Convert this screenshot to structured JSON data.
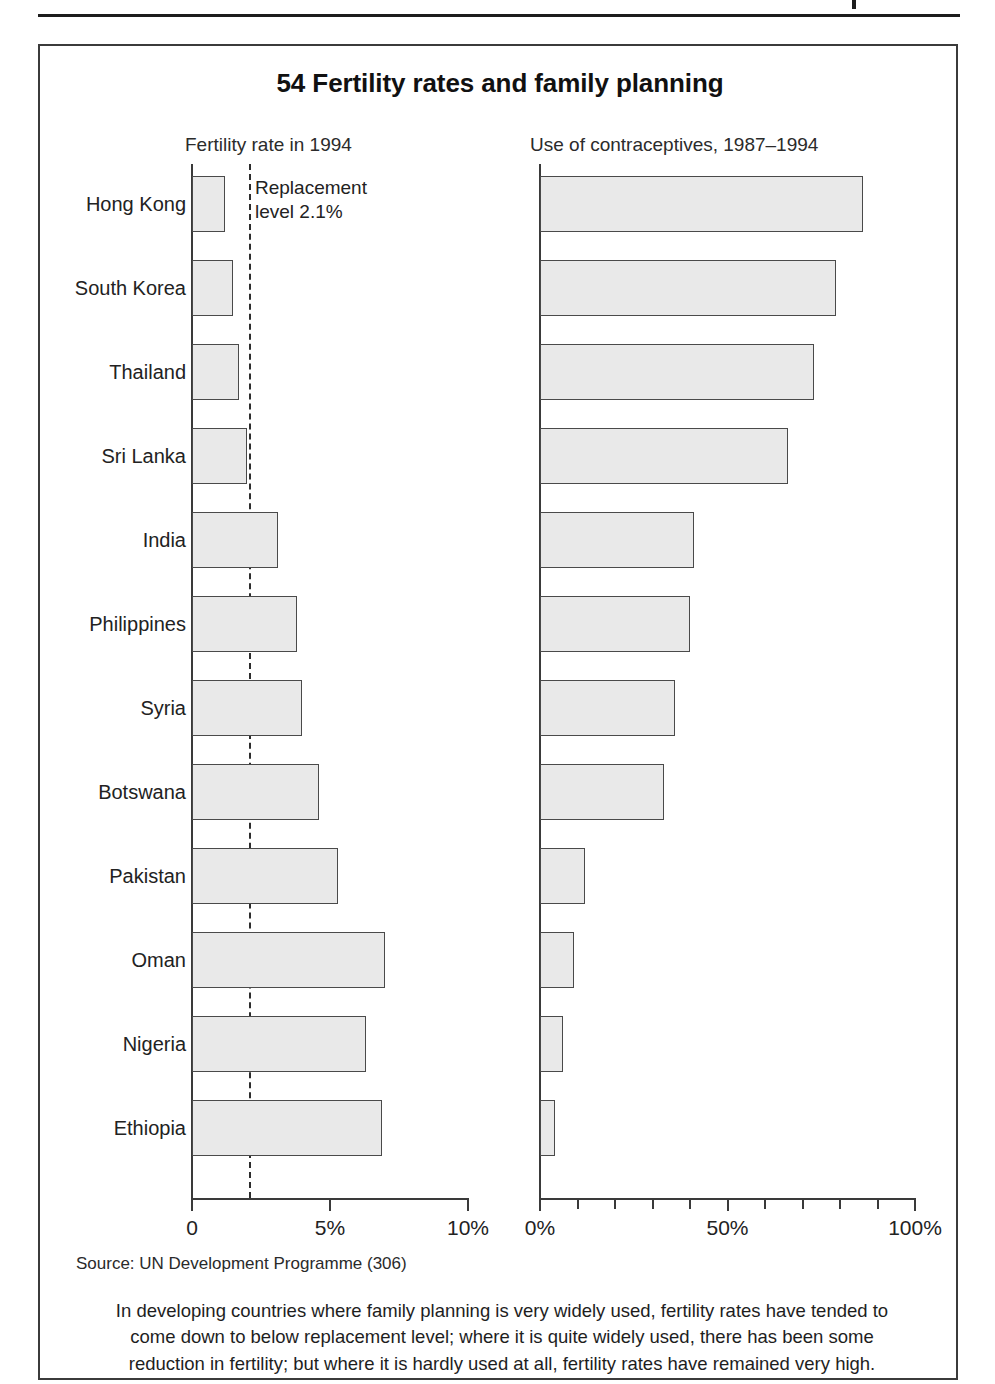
{
  "figure": {
    "title": "54 Fertility rates and family planning",
    "source": "Source: UN Development Programme (306)",
    "caption_line1": "In developing countries where family planning is very widely used, fertility rates have tended to",
    "caption_line2": "come down to below replacement level; where it is quite widely used, there has been some",
    "caption_line3": "reduction in fertility; but where it is hardly used at all, fertility rates have remained very high.",
    "annotation_line1": "Replacement",
    "annotation_line2": "level 2.1%"
  },
  "chart_data": [
    {
      "type": "bar",
      "orientation": "horizontal",
      "title": "Fertility rate in 1994",
      "xlabel": "",
      "ylabel": "",
      "xlim": [
        0,
        10
      ],
      "xticks": [
        0,
        5,
        10
      ],
      "xticklabels": [
        "0",
        "5%",
        "10%"
      ],
      "grid": false,
      "legend": "none",
      "annotations": [
        {
          "text": "Replacement level 2.1%",
          "value": 2.1,
          "style": "dashed-vertical-line"
        }
      ],
      "categories": [
        "Hong Kong",
        "South Korea",
        "Thailand",
        "Sri Lanka",
        "India",
        "Philippines",
        "Syria",
        "Botswana",
        "Pakistan",
        "Oman",
        "Nigeria",
        "Ethiopia"
      ],
      "values": [
        1.2,
        1.5,
        1.7,
        2.0,
        3.1,
        3.8,
        4.0,
        4.6,
        5.3,
        7.0,
        6.3,
        6.9
      ]
    },
    {
      "type": "bar",
      "orientation": "horizontal",
      "title": "Use of contraceptives, 1987–1994",
      "xlabel": "",
      "ylabel": "",
      "xlim": [
        0,
        100
      ],
      "xticks": [
        0,
        50,
        100
      ],
      "xticklabels": [
        "0%",
        "50%",
        "100%"
      ],
      "minor_tick_step": 10,
      "grid": false,
      "legend": "none",
      "categories": [
        "Hong Kong",
        "South Korea",
        "Thailand",
        "Sri Lanka",
        "India",
        "Philippines",
        "Syria",
        "Botswana",
        "Pakistan",
        "Oman",
        "Nigeria",
        "Ethiopia"
      ],
      "values": [
        86,
        79,
        73,
        66,
        41,
        40,
        36,
        33,
        12,
        9,
        6,
        4
      ]
    }
  ]
}
